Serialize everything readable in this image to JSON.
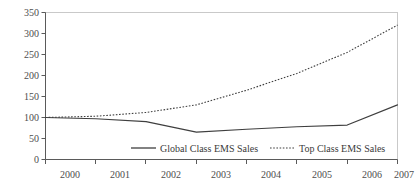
{
  "chart_data": {
    "type": "line",
    "title": "",
    "subtitle": "",
    "xlabel": "",
    "ylabel": "",
    "categories": [
      "2000",
      "2001",
      "2002",
      "2003",
      "2004",
      "2005",
      "2006",
      "2007"
    ],
    "x": [
      2000,
      2001,
      2002,
      2003,
      2004,
      2005,
      2006,
      2007
    ],
    "series": [
      {
        "name": "Global Class EMS Sales",
        "style": "solid",
        "color": "#3f3f3f",
        "values": [
          100,
          97,
          90,
          65,
          72,
          78,
          82,
          130
        ]
      },
      {
        "name": "Top Class EMS Sales",
        "style": "dotted",
        "color": "#3f3f3f",
        "values": [
          100,
          103,
          112,
          130,
          165,
          205,
          255,
          320
        ]
      }
    ],
    "ylim": [
      0,
      350
    ],
    "ytick_values": [
      0,
      50,
      100,
      150,
      200,
      250,
      300,
      350
    ],
    "ytick_labels": [
      "0",
      "50",
      "100",
      "150",
      "200",
      "250",
      "300",
      "350"
    ],
    "xlim": [
      2000,
      2007
    ],
    "grid": false,
    "legend_position": "inside-bottom",
    "legend": [
      {
        "label": "Global Class EMS Sales",
        "style": "solid"
      },
      {
        "label": "Top Class EMS Sales",
        "style": "dotted"
      }
    ],
    "annotations": []
  },
  "axis": {
    "y_labels": [
      "350",
      "300",
      "250",
      "200",
      "150",
      "100",
      "50",
      "0"
    ],
    "x_labels": [
      "2000",
      "2001",
      "2002",
      "2003",
      "2004",
      "2005",
      "2006",
      "2007"
    ]
  },
  "legend": {
    "items": [
      {
        "label": "Global Class EMS Sales"
      },
      {
        "label": "Top Class EMS Sales"
      }
    ]
  },
  "colors": {
    "line": "#3f3f3f",
    "axis": "#5a5a5a",
    "frame": "#c9c9c9",
    "tick_text": "#4d4d4d",
    "background": "#ffffff"
  }
}
